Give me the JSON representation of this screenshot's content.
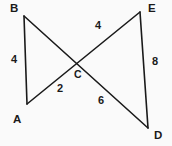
{
  "figure": {
    "background_color": "#fafafa",
    "stroke_color": "#1a1a1a",
    "text_color": "#1a1a1a",
    "width": 172,
    "height": 146
  },
  "vertices": [
    {
      "name": "B",
      "label": "B",
      "x": 24,
      "y": 16,
      "label_x": 10,
      "label_y": 3
    },
    {
      "name": "E",
      "label": "E",
      "x": 140,
      "y": 12,
      "label_x": 148,
      "label_y": 3
    },
    {
      "name": "A",
      "label": "A",
      "x": 27,
      "y": 104,
      "label_x": 13,
      "label_y": 114
    },
    {
      "name": "D",
      "label": "D",
      "x": 148,
      "y": 128,
      "label_x": 154,
      "label_y": 130
    },
    {
      "name": "C",
      "label": "C",
      "x": 72,
      "y": 65,
      "label_x": 74,
      "label_y": 69
    }
  ],
  "segments": [
    {
      "name": "segment-ba",
      "from": "B",
      "to": "A",
      "x1": 24,
      "y1": 16,
      "x2": 27,
      "y2": 104
    },
    {
      "name": "segment-ed",
      "from": "E",
      "to": "D",
      "x1": 140,
      "y1": 12,
      "x2": 148,
      "y2": 128
    },
    {
      "name": "segment-bd",
      "from": "B",
      "to": "D",
      "x1": 24,
      "y1": 16,
      "x2": 148,
      "y2": 128
    },
    {
      "name": "segment-ae",
      "from": "A",
      "to": "E",
      "x1": 27,
      "y1": 104,
      "x2": 140,
      "y2": 12
    }
  ],
  "measurements": [
    {
      "name": "length-ab",
      "value": "4",
      "segment": "segment-ba",
      "x": 11,
      "y": 54
    },
    {
      "name": "length-ce",
      "value": "4",
      "segment": "segment-ae",
      "x": 95,
      "y": 20
    },
    {
      "name": "length-de",
      "value": "8",
      "segment": "segment-ed",
      "x": 152,
      "y": 56
    },
    {
      "name": "length-ac",
      "value": "2",
      "segment": "segment-ae",
      "x": 57,
      "y": 83
    },
    {
      "name": "length-cd",
      "value": "6",
      "segment": "segment-bd",
      "x": 98,
      "y": 95
    }
  ]
}
